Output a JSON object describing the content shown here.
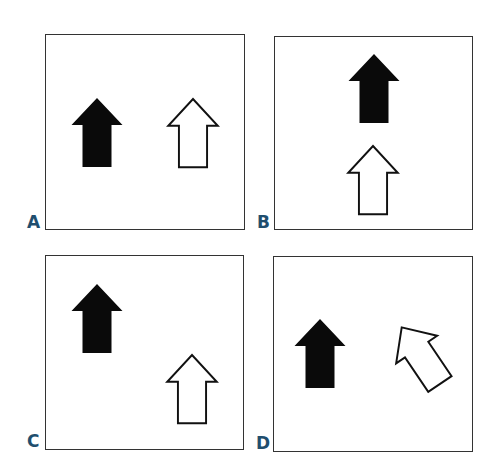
{
  "figure": {
    "label_color": "#1f4e6e",
    "panels": [
      {
        "label": "A",
        "box": {
          "x": 45,
          "y": 34,
          "w": 200,
          "h": 196
        },
        "label_pos": {
          "x": 27,
          "y": 214
        }
      },
      {
        "label": "B",
        "box": {
          "x": 274,
          "y": 36,
          "w": 199,
          "h": 194
        },
        "label_pos": {
          "x": 257,
          "y": 214
        }
      },
      {
        "label": "C",
        "box": {
          "x": 45,
          "y": 255,
          "w": 199,
          "h": 195
        },
        "label_pos": {
          "x": 27,
          "y": 432
        }
      },
      {
        "label": "D",
        "box": {
          "x": 273,
          "y": 256,
          "w": 200,
          "h": 196
        },
        "label_pos": {
          "x": 255,
          "y": 435
        }
      }
    ],
    "arrows": [
      {
        "panel": "A",
        "fill": "black",
        "tip_x": 97,
        "tip_y": 98,
        "rotation": 0
      },
      {
        "panel": "A",
        "fill": "white",
        "tip_x": 193,
        "tip_y": 99,
        "rotation": 0
      },
      {
        "panel": "B",
        "fill": "black",
        "tip_x": 374,
        "tip_y": 54,
        "rotation": 0
      },
      {
        "panel": "B",
        "fill": "white",
        "tip_x": 373,
        "tip_y": 146,
        "rotation": 0
      },
      {
        "panel": "C",
        "fill": "black",
        "tip_x": 97,
        "tip_y": 284,
        "rotation": 0
      },
      {
        "panel": "C",
        "fill": "white",
        "tip_x": 192,
        "tip_y": 355,
        "rotation": 0
      },
      {
        "panel": "D",
        "fill": "black",
        "tip_x": 320,
        "tip_y": 319,
        "rotation": 0
      },
      {
        "panel": "D",
        "fill": "white",
        "center_x": 421,
        "center_y": 356,
        "rotation": -34
      }
    ]
  }
}
